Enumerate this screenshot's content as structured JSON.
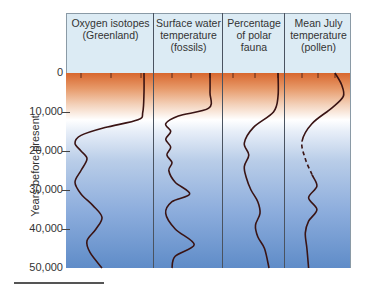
{
  "chart_data": [
    {
      "type": "line",
      "title": "Oxygen isotopes (Greenland)",
      "x_ticks": [
        "-40",
        "-35",
        "-30"
      ],
      "xlim": [
        -42,
        -28
      ],
      "ylabel": "Years before present",
      "y": [
        0,
        5000,
        10000,
        12000,
        14000,
        16000,
        18000,
        20000,
        22000,
        25000,
        28000,
        31000,
        34000,
        37000,
        40000,
        43000,
        46000,
        50000
      ],
      "values": [
        -29.5,
        -29.5,
        -29.7,
        -30.5,
        -36,
        -40,
        -41,
        -40,
        -39,
        -40,
        -41,
        -40,
        -38,
        -36.5,
        -37.5,
        -39,
        -38.5,
        -36.5
      ]
    },
    {
      "type": "line",
      "title": "Surface water temperature (fossils)",
      "x_ticks": [
        "8°",
        "11°",
        "14°"
      ],
      "xlim": [
        5,
        17
      ],
      "y": [
        0,
        5000,
        9000,
        11000,
        13000,
        15000,
        17000,
        19000,
        21000,
        23000,
        25000,
        28000,
        31000,
        33000,
        36000,
        40000,
        44000,
        47000,
        50000
      ],
      "values": [
        14,
        14,
        13.8,
        9,
        7,
        7.8,
        7,
        7.8,
        7.2,
        8,
        7.5,
        8.5,
        10.8,
        8,
        7,
        8.5,
        11.5,
        8.5,
        8
      ]
    },
    {
      "type": "line",
      "title": "Percentage of polar fauna",
      "x_ticks": [
        "100",
        "50",
        "0"
      ],
      "xlim": [
        120,
        -20
      ],
      "y": [
        0,
        6000,
        10000,
        14000,
        18000,
        21000,
        24000,
        27000,
        30000,
        33000,
        36000,
        39000,
        42000,
        45000,
        50000
      ],
      "values": [
        0,
        0,
        10,
        55,
        75,
        65,
        75,
        70,
        60,
        45,
        40,
        50,
        45,
        30,
        20
      ]
    },
    {
      "type": "line",
      "title": "Mean July temperature (pollen)",
      "x_ticks": [
        "5°",
        "10°",
        "15°"
      ],
      "xlim": [
        0,
        20
      ],
      "dashed_range": [
        17500,
        26000
      ],
      "y": [
        0,
        3000,
        6000,
        9000,
        13000,
        17500,
        22000,
        26000,
        29000,
        32000,
        35000,
        38000,
        41000,
        45000,
        50000
      ],
      "values": [
        15,
        17,
        17.5,
        14,
        8,
        5,
        6,
        8,
        9.5,
        7,
        9.5,
        7,
        6,
        6.5,
        7
      ]
    }
  ],
  "y_axis": {
    "label": "Years before present",
    "ticks": [
      "0",
      "10,000",
      "20,000",
      "30,000",
      "40,000",
      "50,000"
    ],
    "ylim": [
      0,
      50000
    ]
  },
  "panels": [
    {
      "title_line1": "Oxygen isotopes",
      "title_line2": "(Greenland)",
      "title_line3": "",
      "ticks": [
        "−40",
        "−35",
        "−30"
      ]
    },
    {
      "title_line1": "Surface water",
      "title_line2": "temperature",
      "title_line3": "(fossils)",
      "ticks": [
        "8°",
        "11°",
        "14°"
      ]
    },
    {
      "title_line1": "Percentage",
      "title_line2": "of polar",
      "title_line3": "fauna",
      "ticks": [
        "100",
        "50",
        "0"
      ]
    },
    {
      "title_line1": "Mean July",
      "title_line2": "temperature",
      "title_line3": "(pollen)",
      "ticks": [
        "5°",
        "10°",
        "15°"
      ]
    }
  ],
  "colors": {
    "warm": "#d8672e",
    "cold": "#5f8cc8",
    "curve": "#3a1414",
    "header_bg": "#dcebf4"
  }
}
